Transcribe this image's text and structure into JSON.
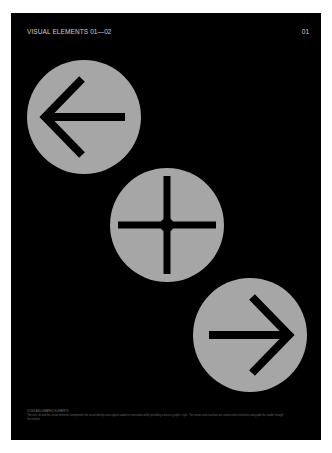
{
  "header": {
    "title": "VISUAL ELEMENTS 01—02",
    "page_number": "01"
  },
  "elements": [
    {
      "name": "arrow-left",
      "icon": "arrow-left-icon"
    },
    {
      "name": "crosshair",
      "icon": "plus-crosshair-icon"
    },
    {
      "name": "arrow-right",
      "icon": "arrow-right-icon"
    }
  ],
  "colors": {
    "background": "#000000",
    "disc": "#a6a6a6",
    "glyph": "#000000",
    "page": "#ffffff"
  },
  "caption": {
    "title": "ICONS AND GRAPHIC ELEMENTS",
    "body": "The icon set and the visual elements complement the visual identity and support audience orientation while providing a distinct graphic style. The arrows and crosshair are used to direct attention and guide the reader through the content."
  }
}
